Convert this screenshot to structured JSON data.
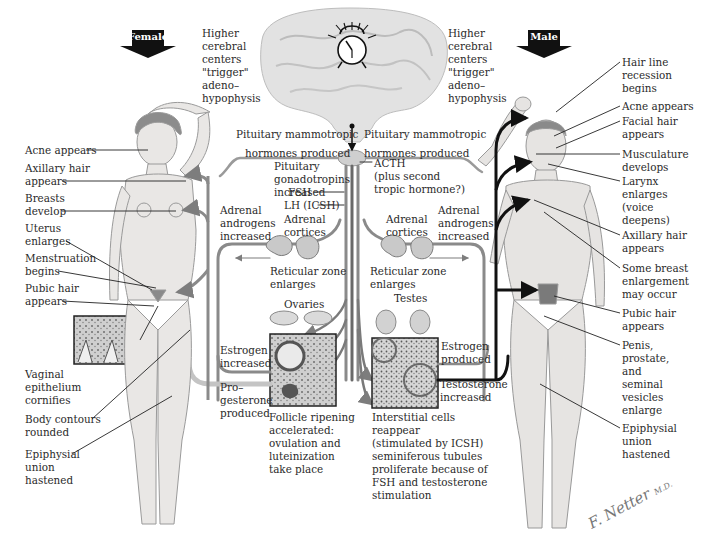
{
  "banners": {
    "female": "Female",
    "male": "Male"
  },
  "center": {
    "cerebral_left": [
      "Higher",
      "cerebral",
      "centers",
      "\"trigger\"",
      "adeno–",
      "hypophysis"
    ],
    "cerebral_right": [
      "Higher",
      "cerebral",
      "centers",
      "\"trigger\"",
      "adeno–",
      "hypophysis"
    ],
    "mammotropic_left": [
      "Pituitary mammotropic",
      "hormones produced"
    ],
    "mammotropic_right": [
      "Pituitary mammotropic",
      "hormones produced"
    ],
    "gonadotropins": [
      "Pituitary",
      "gonadotropins",
      "increased"
    ],
    "fsh": "FSH",
    "lh": "LH (ICSH)",
    "acth": [
      "ACTH",
      "(plus second",
      "tropic hormone?)"
    ],
    "adrenal_androgens_left": [
      "Adrenal",
      "androgens",
      "increased"
    ],
    "adrenal_androgens_right": [
      "Adrenal",
      "androgens",
      "increased"
    ],
    "adrenal_cortices_left": [
      "Adrenal",
      "cortices"
    ],
    "adrenal_cortices_right": [
      "Adrenal",
      "cortices"
    ],
    "reticular_left": [
      "Reticular zone",
      "enlarges"
    ],
    "reticular_right": [
      "Reticular zone",
      "enlarges"
    ],
    "ovaries": "Ovaries",
    "testes": "Testes",
    "estrogen_increased": [
      "Estrogen",
      "increased"
    ],
    "progesterone": [
      "Pro–",
      "gesterone",
      "produced"
    ],
    "estrogen_produced": [
      "Estrogen",
      "produced"
    ],
    "testosterone": [
      "Testosterone",
      "increased"
    ],
    "follicle": [
      "Follicle ripening",
      "accelerated:",
      "ovulation and",
      "luteinization",
      "take place"
    ],
    "interstitial": [
      "Interstitial cells",
      "reappear",
      "(stimulated by ICSH)",
      "seminiferous tubules",
      "proliferate because of",
      "FSH and testosterone",
      "stimulation"
    ]
  },
  "female_labels": [
    {
      "id": "acne",
      "lines": [
        "Acne appears"
      ]
    },
    {
      "id": "axillary-hair",
      "lines": [
        "Axillary hair",
        "appears"
      ]
    },
    {
      "id": "breasts",
      "lines": [
        "Breasts",
        "develop"
      ]
    },
    {
      "id": "uterus",
      "lines": [
        "Uterus",
        "enlarges"
      ]
    },
    {
      "id": "menstruation",
      "lines": [
        "Menstruation",
        "begins"
      ]
    },
    {
      "id": "pubic-hair",
      "lines": [
        "Pubic hair",
        "appears"
      ]
    },
    {
      "id": "vaginal-epithelium",
      "lines": [
        "Vaginal",
        "epithelium",
        "cornifies"
      ]
    },
    {
      "id": "body-contours",
      "lines": [
        "Body contours",
        "rounded"
      ]
    },
    {
      "id": "epiphysial-union",
      "lines": [
        "Epiphysial",
        "union",
        "hastened"
      ]
    }
  ],
  "male_labels": [
    {
      "id": "hair-line",
      "lines": [
        "Hair line",
        "recession",
        "begins"
      ]
    },
    {
      "id": "acne",
      "lines": [
        "Acne appears"
      ]
    },
    {
      "id": "facial-hair",
      "lines": [
        "Facial hair",
        "appears"
      ]
    },
    {
      "id": "musculature",
      "lines": [
        "Musculature",
        "develops"
      ]
    },
    {
      "id": "larynx",
      "lines": [
        "Larynx",
        "enlarges",
        "(voice",
        "deepens)"
      ]
    },
    {
      "id": "axillary-hair",
      "lines": [
        "Axillary hair",
        "appears"
      ]
    },
    {
      "id": "breast-enlargement",
      "lines": [
        "Some breast",
        "enlargement",
        "may occur"
      ]
    },
    {
      "id": "pubic-hair",
      "lines": [
        "Pubic hair",
        "appears"
      ]
    },
    {
      "id": "penis-prostate",
      "lines": [
        "Penis,",
        "prostate,",
        "and",
        "seminal",
        "vesicles",
        "enlarge"
      ]
    },
    {
      "id": "epiphysial-union",
      "lines": [
        "Epiphysial",
        "union",
        "hastened"
      ]
    }
  ],
  "signature": {
    "name": "F. Netter",
    "suffix": "M.D."
  },
  "colors": {
    "pathway_gray": "#8a8a8a",
    "pathway_light": "#c8c8c8",
    "pathway_dark": "#1a1a1a",
    "skin": "#e6e4e2",
    "brain": "#dcdcdc",
    "banner": "#111111"
  }
}
